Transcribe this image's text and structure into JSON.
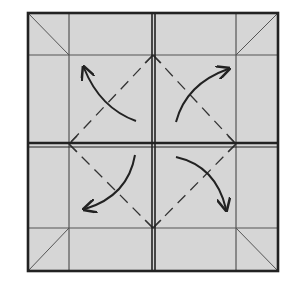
{
  "diagram": {
    "type": "origami-folding-step",
    "colors": {
      "background": "#ffffff",
      "paper": "#d6d6d6",
      "line": "#3a3a3a",
      "thick_line": "#222222"
    },
    "square": {
      "x": 27,
      "y": 12,
      "size": 252
    },
    "grid_lines": {
      "verticals": [
        69,
        236
      ],
      "horizontals": [
        55,
        228
      ],
      "center_vertical": 153,
      "center_horizontal": 144
    },
    "fold_lines": [
      {
        "kind": "valley-dashed",
        "from": "top-mid",
        "to": "left-mid"
      },
      {
        "kind": "valley-dashed",
        "from": "top-mid",
        "to": "right-mid"
      },
      {
        "kind": "valley-dashed",
        "from": "bottom-mid",
        "to": "left-mid"
      },
      {
        "kind": "valley-dashed",
        "from": "bottom-mid",
        "to": "right-mid"
      }
    ],
    "corner_diagonals": [
      "top-left",
      "top-right",
      "bottom-left",
      "bottom-right"
    ],
    "arrows": [
      {
        "quadrant": "top-left",
        "direction": "toward-corner"
      },
      {
        "quadrant": "top-right",
        "direction": "toward-corner"
      },
      {
        "quadrant": "bottom-left",
        "direction": "toward-corner"
      },
      {
        "quadrant": "bottom-right",
        "direction": "toward-corner"
      }
    ]
  }
}
